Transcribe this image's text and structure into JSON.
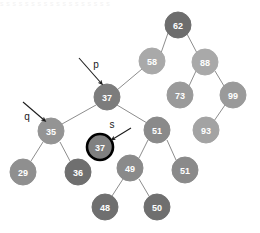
{
  "figure": {
    "title_strip": "s s   s s s s s s s s s s   s s s s s s",
    "canvas": {
      "width": 260,
      "height": 233,
      "background": "#ffffff"
    }
  },
  "chart_data": {
    "type": "diagram",
    "diagram_kind": "binary-search-tree",
    "title": "",
    "nodes": [
      {
        "id": "n62",
        "value": "62",
        "cx": 178,
        "cy": 25,
        "r": 13,
        "fill": "#6d6d6d",
        "stroke": "#6d6d6d",
        "stroke_width": 1,
        "highlighted": false
      },
      {
        "id": "n58",
        "value": "58",
        "cx": 152,
        "cy": 61,
        "r": 13,
        "fill": "#a9a9a9",
        "stroke": "#a9a9a9",
        "stroke_width": 1,
        "highlighted": false
      },
      {
        "id": "n88",
        "value": "88",
        "cx": 205,
        "cy": 62,
        "r": 13,
        "fill": "#a9a9a9",
        "stroke": "#a9a9a9",
        "stroke_width": 1,
        "highlighted": false
      },
      {
        "id": "n37p",
        "value": "37",
        "cx": 107,
        "cy": 97,
        "r": 13,
        "fill": "#7c7c7c",
        "stroke": "#7c7c7c",
        "stroke_width": 1,
        "highlighted": false
      },
      {
        "id": "n73",
        "value": "73",
        "cx": 180,
        "cy": 95,
        "r": 13,
        "fill": "#9a9a9a",
        "stroke": "#9a9a9a",
        "stroke_width": 1,
        "highlighted": false
      },
      {
        "id": "n99",
        "value": "99",
        "cx": 233,
        "cy": 95,
        "r": 13,
        "fill": "#9a9a9a",
        "stroke": "#9a9a9a",
        "stroke_width": 1,
        "highlighted": false
      },
      {
        "id": "n35",
        "value": "35",
        "cx": 51,
        "cy": 131,
        "r": 13,
        "fill": "#949494",
        "stroke": "#949494",
        "stroke_width": 1,
        "highlighted": false
      },
      {
        "id": "n51",
        "value": "51",
        "cx": 157,
        "cy": 130,
        "r": 13,
        "fill": "#8a8a8a",
        "stroke": "#8a8a8a",
        "stroke_width": 1,
        "highlighted": false
      },
      {
        "id": "n93",
        "value": "93",
        "cx": 206,
        "cy": 130,
        "r": 13,
        "fill": "#a3a3a3",
        "stroke": "#a3a3a3",
        "stroke_width": 1,
        "highlighted": false
      },
      {
        "id": "n37s",
        "value": "37",
        "cx": 100,
        "cy": 147,
        "r": 13,
        "fill": "#808080",
        "stroke": "#000000",
        "stroke_width": 2.6,
        "highlighted": true
      },
      {
        "id": "n29",
        "value": "29",
        "cx": 23,
        "cy": 172,
        "r": 13,
        "fill": "#8f8f8f",
        "stroke": "#8f8f8f",
        "stroke_width": 1,
        "highlighted": false
      },
      {
        "id": "n36",
        "value": "36",
        "cx": 78,
        "cy": 172,
        "r": 13,
        "fill": "#6f6f6f",
        "stroke": "#6f6f6f",
        "stroke_width": 1,
        "highlighted": false
      },
      {
        "id": "n49",
        "value": "49",
        "cx": 130,
        "cy": 168,
        "r": 13,
        "fill": "#8a8a8a",
        "stroke": "#8a8a8a",
        "stroke_width": 1,
        "highlighted": false
      },
      {
        "id": "n51b",
        "value": "51",
        "cx": 185,
        "cy": 170,
        "r": 13,
        "fill": "#8a8a8a",
        "stroke": "#8a8a8a",
        "stroke_width": 1,
        "highlighted": false
      },
      {
        "id": "n48",
        "value": "48",
        "cx": 105,
        "cy": 207,
        "r": 13,
        "fill": "#6f6f6f",
        "stroke": "#6f6f6f",
        "stroke_width": 1,
        "highlighted": false
      },
      {
        "id": "n50",
        "value": "50",
        "cx": 157,
        "cy": 207,
        "r": 13,
        "fill": "#6f6f6f",
        "stroke": "#6f6f6f",
        "stroke_width": 1,
        "highlighted": false
      }
    ],
    "edges": [
      {
        "from": "n62",
        "to": "n58",
        "x1": 168,
        "y1": 33,
        "x2": 161,
        "y2": 53
      },
      {
        "from": "n62",
        "to": "n88",
        "x1": 187,
        "y1": 34,
        "x2": 197,
        "y2": 53
      },
      {
        "from": "n58",
        "to": "n37p",
        "x1": 142,
        "y1": 69,
        "x2": 117,
        "y2": 90
      },
      {
        "from": "n88",
        "to": "n73",
        "x1": 196,
        "y1": 71,
        "x2": 189,
        "y2": 86
      },
      {
        "from": "n88",
        "to": "n99",
        "x1": 215,
        "y1": 71,
        "x2": 224,
        "y2": 86
      },
      {
        "from": "n99",
        "to": "n93",
        "x1": 225,
        "y1": 105,
        "x2": 214,
        "y2": 121
      },
      {
        "from": "n37p",
        "to": "n35",
        "x1": 96,
        "y1": 105,
        "x2": 62,
        "y2": 124
      },
      {
        "from": "n37p",
        "to": "n51",
        "x1": 117,
        "y1": 105,
        "x2": 147,
        "y2": 123
      },
      {
        "from": "n35",
        "to": "n29",
        "x1": 43,
        "y1": 142,
        "x2": 31,
        "y2": 161
      },
      {
        "from": "n35",
        "to": "n36",
        "x1": 60,
        "y1": 142,
        "x2": 70,
        "y2": 161
      },
      {
        "from": "n51",
        "to": "n49",
        "x1": 148,
        "y1": 140,
        "x2": 139,
        "y2": 158
      },
      {
        "from": "n51",
        "to": "n51b",
        "x1": 167,
        "y1": 140,
        "x2": 176,
        "y2": 160
      },
      {
        "from": "n49",
        "to": "n48",
        "x1": 123,
        "y1": 179,
        "x2": 112,
        "y2": 196
      },
      {
        "from": "n49",
        "to": "n50",
        "x1": 139,
        "y1": 179,
        "x2": 149,
        "y2": 196
      }
    ],
    "pointers": [
      {
        "id": "ptr-p",
        "label": "p",
        "target": "n37p",
        "label_x": 96,
        "label_y": 64,
        "line_x1": 79,
        "line_y1": 58,
        "line_x2": 101,
        "line_y2": 83,
        "head_x": 103,
        "head_y": 86
      },
      {
        "id": "ptr-q",
        "label": "q",
        "target": "n35",
        "label_x": 27,
        "label_y": 116,
        "line_x1": 23,
        "line_y1": 102,
        "line_x2": 44,
        "line_y2": 120,
        "head_x": 46,
        "head_y": 123
      },
      {
        "id": "ptr-s",
        "label": "s",
        "target": "n37s",
        "label_x": 112,
        "label_y": 124,
        "line_x1": 131,
        "line_y1": 128,
        "line_x2": 113,
        "line_y2": 139,
        "head_x": 110,
        "head_y": 141
      }
    ],
    "colors": {
      "edge": "#8d8d8d",
      "arrow": "#1c1c1c",
      "node_text": "#ffffff",
      "highlight_stroke": "#000000",
      "background": "#ffffff"
    }
  }
}
